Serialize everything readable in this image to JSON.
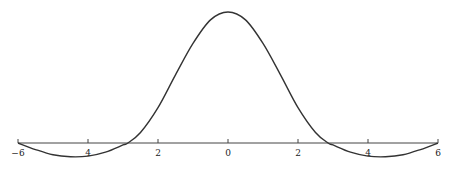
{
  "chart_data": {
    "type": "line",
    "title": "",
    "xlabel": "",
    "ylabel": "",
    "xlim": [
      -6,
      6
    ],
    "ylim": [
      -0.12,
      1.0
    ],
    "grid": false,
    "legend": null,
    "x_ticks": [
      -6,
      -4,
      -2,
      0,
      2,
      4,
      6
    ],
    "x_tick_labels": [
      "−6",
      "4",
      "2",
      "0",
      "2",
      "4",
      "6"
    ],
    "series": [
      {
        "name": "f(x)",
        "x": [
          -6,
          -5.5,
          -5,
          -4.5,
          -4,
          -3.5,
          -3,
          -2.86,
          -2.5,
          -2,
          -1.5,
          -1,
          -0.5,
          0,
          0.5,
          1,
          1.5,
          2,
          2.5,
          2.86,
          3,
          3.5,
          4,
          4.5,
          5,
          5.5,
          6
        ],
        "y": [
          0,
          -0.05,
          -0.09,
          -0.105,
          -0.1,
          -0.07,
          -0.015,
          0,
          0.08,
          0.27,
          0.52,
          0.76,
          0.94,
          1.0,
          0.94,
          0.76,
          0.52,
          0.27,
          0.08,
          0,
          -0.015,
          -0.07,
          -0.1,
          -0.105,
          -0.09,
          -0.05,
          0
        ]
      }
    ]
  }
}
